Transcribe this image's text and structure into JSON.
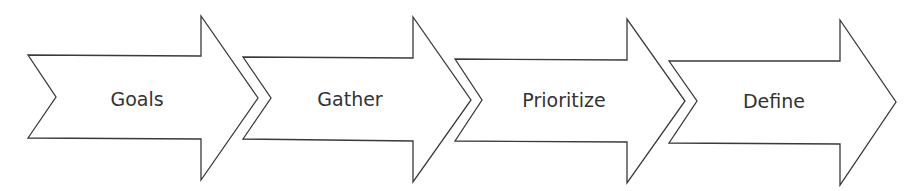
{
  "diagram": {
    "type": "process-flow",
    "direction": "left-to-right",
    "colors": {
      "stroke": "#3a3a3a",
      "fill": "#ffffff",
      "text": "#333333",
      "background": "#ffffff"
    },
    "steps": [
      {
        "label": "Goals"
      },
      {
        "label": "Gather"
      },
      {
        "label": "Prioritize"
      },
      {
        "label": "Define"
      }
    ]
  }
}
